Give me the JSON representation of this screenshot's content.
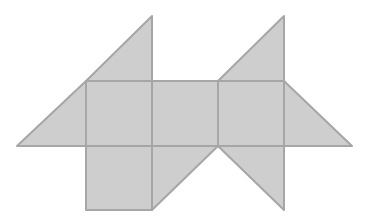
{
  "diagram": {
    "type": "geometric-net",
    "fill_color": "#cecece",
    "stroke_color": "#a6a6a6",
    "background": "#ffffff",
    "unit": 66,
    "squares": [
      {
        "id": "sq-top-left",
        "points": "86,81 152,81 152,146 86,146"
      },
      {
        "id": "sq-top-middle",
        "points": "152,81 218,81 218,146 152,146"
      },
      {
        "id": "sq-top-right",
        "points": "218,81 284,81 284,146 218,146"
      },
      {
        "id": "sq-bottom-left",
        "points": "86,146 152,146 152,210 86,210"
      }
    ],
    "triangles": [
      {
        "id": "tri-top-left",
        "points": "86,81 152,16 152,81"
      },
      {
        "id": "tri-left",
        "points": "17,146 86,81 86,146"
      },
      {
        "id": "tri-bottom-middle",
        "points": "152,146 218,146 152,210"
      },
      {
        "id": "tri-top-right",
        "points": "218,81 284,16 284,81"
      },
      {
        "id": "tri-right",
        "points": "284,81 352,146 284,146"
      },
      {
        "id": "tri-bottom-right",
        "points": "218,146 284,146 284,210"
      }
    ]
  }
}
